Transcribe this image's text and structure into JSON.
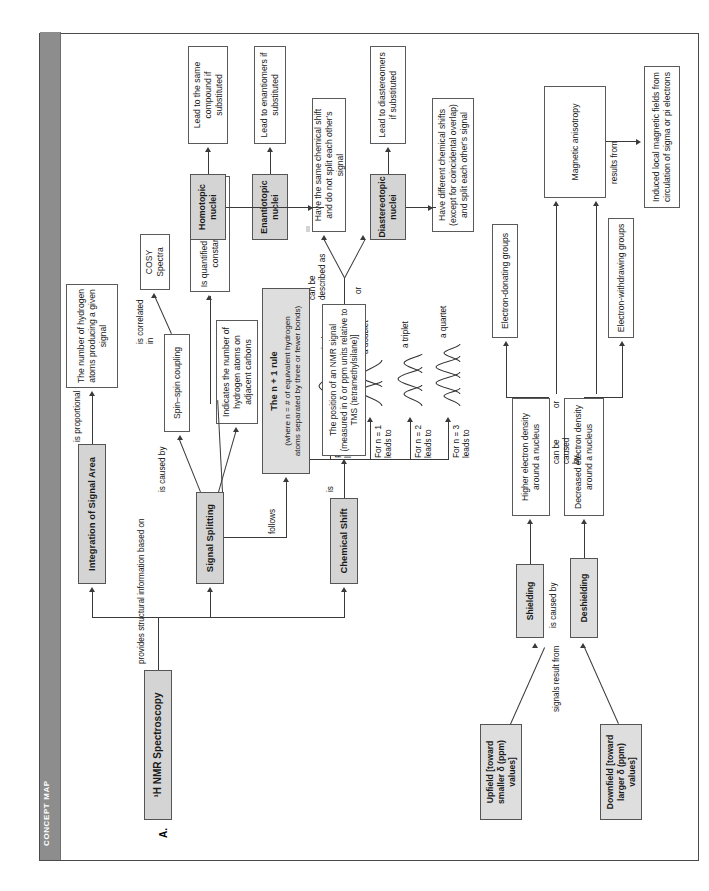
{
  "page": {
    "spine_label": "CONCEPT MAP",
    "section_tag": "A.",
    "title": "¹H NMR Spectroscopy"
  },
  "root_link": "provides structural information based on",
  "branches": {
    "chemical_shift": {
      "label": "Chemical Shift",
      "link_is": "is",
      "definition": "The position of an NMR signal\n(measured in δ or ppm units\nrelative to TMS (tetramethylsilane)]",
      "link_described": "can be\ndescribed as",
      "link_or": "or",
      "upfield": "Upfield\n[toward smaller δ\n(ppm) values]",
      "downfield": "Downfield\n[toward larger δ\n(ppm) values]",
      "link_signals_result": "signals result from",
      "shielding": "Shielding",
      "deshielding": "Deshielding",
      "link_is_caused_by": "is caused by",
      "higher_density": "Higher electron density\naround a nucleus",
      "decreased_density": "Decreased electron density\naround a nucleus",
      "link_can_be_caused_by": "can be\ncaused\nby",
      "link_or2": "or",
      "electron_donating": "Electron-donating groups",
      "electron_withdrawing": "Electron-withdrawing groups",
      "magnetic_anisotropy": "Magnetic anisotropy",
      "link_results_from": "results from",
      "induced_fields": "Induced local magnetic fields from\ncirculation of sigma or pi electrons"
    },
    "signal_splitting": {
      "label": "Signal Splitting",
      "indicates": "Indicates the number\nof hydrogen atoms\non adjacent carbons",
      "link_is_caused_by": "is caused by",
      "spin_spin": "Spin–spin coupling",
      "link_is_correlated_in": "is correlated\nin",
      "cosy": "COSY\nSpectra",
      "coupling_constant": "Is quantified by the\ncoupling constant (J) in Hz",
      "link_follows": "follows",
      "n_plus_1_title": "The n + 1 rule",
      "n_plus_1_sub": "(where n = # of equivalent hydrogen\natoms separated by three or fewer bonds)",
      "multiplets": [
        {
          "cond": "For n = 0\nleads to",
          "name": "a singlet",
          "peaks": 1
        },
        {
          "cond": "For n = 1\nleads to",
          "name": "a doublet",
          "peaks": 2
        },
        {
          "cond": "For n = 2\nleads to",
          "name": "a triplet",
          "peaks": 3
        },
        {
          "cond": "For n = 3\nleads to",
          "name": "a quartet",
          "peaks": 4
        }
      ]
    },
    "integration": {
      "label": "Integration of Signal Area",
      "link_is_proportional": "is proportional to",
      "result": "The number of\nhydrogen atoms\nproducing a\ngiven signal"
    },
    "nuclei": {
      "homotopic": "Homotopic\nnuclei",
      "homotopic_result": "Lead to the same\ncompound\nif substituted",
      "enantiotopic": "Enantiotopic\nnuclei",
      "enantiotopic_result": "Lead to enantiomers\nif substituted",
      "same_shift": "Have the same chemical shift\nand do not split each other's signal",
      "diastereotopic": "Diastereotopic\nnuclei",
      "diastereotopic_result": "Lead to diastereomers\nif substituted",
      "different_shift": "Have different chemical shifts\n(except for coincidental overlap)\nand split each other's signal"
    }
  },
  "colors": {
    "spine": "#8d8d8d",
    "shaded_box": "#d4d4d4",
    "line": "#3a3a3a",
    "border": "#5a5a5a"
  }
}
